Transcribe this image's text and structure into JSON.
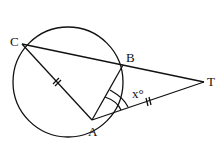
{
  "diagram": {
    "type": "geometry",
    "circle": {
      "cx": 68,
      "cy": 82,
      "r": 55
    },
    "points": {
      "C": {
        "x": 22,
        "y": 44,
        "label": "C"
      },
      "B": {
        "x": 123,
        "y": 65,
        "label": "B"
      },
      "A": {
        "x": 92,
        "y": 120,
        "label": "A"
      },
      "T": {
        "x": 204,
        "y": 82,
        "label": "T"
      }
    },
    "angle_label": "x°",
    "segments": [
      "CB",
      "BT",
      "CA",
      "AB",
      "AT"
    ],
    "equal_marks": [
      "CA",
      "AT"
    ]
  }
}
